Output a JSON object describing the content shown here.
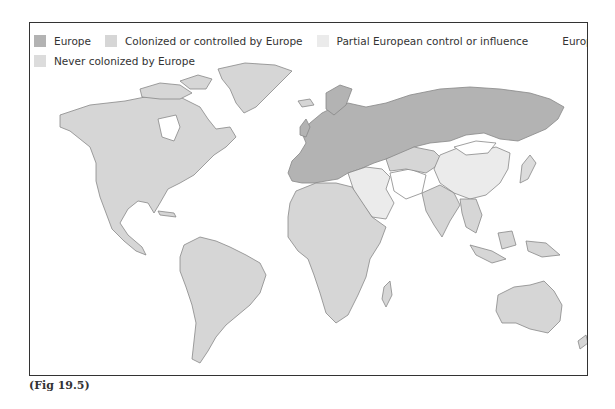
{
  "legend": {
    "items": [
      {
        "label": "Europe",
        "color": "#b3b3b3"
      },
      {
        "label": "Colonized or controlled by Europe",
        "color": "#d6d6d6"
      },
      {
        "label": "Partial European control or influence",
        "color": "#ebebeb"
      },
      {
        "label": "European sphere of inf",
        "color": "#ffffff"
      },
      {
        "label": "Never colonized by Europe",
        "color": "#dcdcdc"
      }
    ]
  },
  "map": {
    "subject": "World map of European colonization",
    "regions": [
      {
        "name": "North America",
        "category": "Colonized or controlled by Europe"
      },
      {
        "name": "Greenland",
        "category": "Colonized or controlled by Europe"
      },
      {
        "name": "South America",
        "category": "Colonized or controlled by Europe"
      },
      {
        "name": "Africa",
        "category": "Colonized or controlled by Europe"
      },
      {
        "name": "Europe and Russia",
        "category": "Europe"
      },
      {
        "name": "Turkey and Middle East",
        "category": "Partial European control or influence"
      },
      {
        "name": "China",
        "category": "Partial European control or influence"
      },
      {
        "name": "Iran, Afghanistan, Mongolia",
        "category": "European sphere of influence"
      },
      {
        "name": "India and Southeast Asia",
        "category": "Colonized or controlled by Europe"
      },
      {
        "name": "Japan",
        "category": "Never colonized by Europe"
      },
      {
        "name": "Australia",
        "category": "Colonized or controlled by Europe"
      }
    ]
  },
  "caption": "(Fig 19.5)"
}
